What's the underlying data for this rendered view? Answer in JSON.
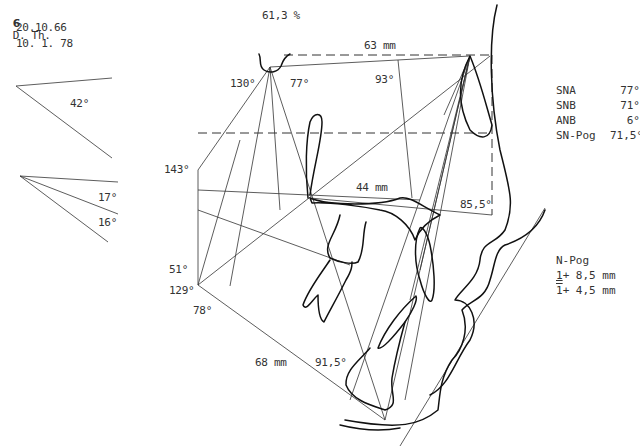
{
  "header": {
    "figure_number": "6",
    "patient": "D. Th.",
    "birth_date": "20.10.66",
    "exam_date": "10. 1. 78"
  },
  "ratio_label": "61,3 %",
  "side_angles": {
    "upper": "42°",
    "lower_1": "17°",
    "lower_2": "16°"
  },
  "tracing_labels": {
    "s_n_length": "63 mm",
    "angle_93": "93°",
    "angle_130": "130°",
    "angle_77": "77°",
    "angle_143": "143°",
    "palatal_length": "44 mm",
    "angle_85_5": "85,5°",
    "angle_51": "51°",
    "angle_129": "129°",
    "angle_78": "78°",
    "mandible_length": "68 mm",
    "angle_91_5": "91,5°"
  },
  "measurements": [
    {
      "name": "SNA",
      "value": "77°"
    },
    {
      "name": "SNB",
      "value": "71°"
    },
    {
      "name": "ANB",
      "value": "6°"
    },
    {
      "name": "SN-Pog",
      "value": "71,5°"
    }
  ],
  "incisor_notes": {
    "title": "N-Pog",
    "upper_digit": "1",
    "upper_value": " + 8,5 mm",
    "lower_digit": "1",
    "lower_value": " + 4,5 mm"
  }
}
